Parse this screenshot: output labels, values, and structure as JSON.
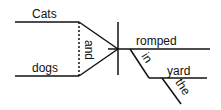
{
  "diagram": {
    "type": "sentence-diagram",
    "sentence": "Cats and dogs romped in the yard",
    "subjects": [
      "Cats",
      "dogs"
    ],
    "conjunction": "and",
    "verb": "romped",
    "preposition": "in",
    "object": "yard",
    "article": "the",
    "line_color": "#111111"
  }
}
